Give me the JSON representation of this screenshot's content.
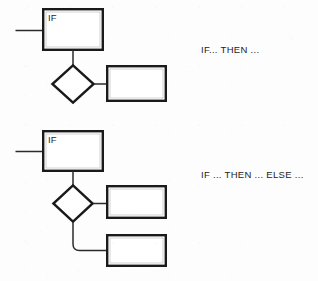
{
  "diagram": {
    "type": "flowchart",
    "background_color": "#fdfdfd",
    "stroke_color": "#1a1a1a",
    "connector_color": "#2b2b2b",
    "blocks": [
      {
        "id": "if-then",
        "caption": "IF... THEN ...",
        "condition_label": "IF",
        "nodes": [
          {
            "name": "condition-box",
            "shape": "rectangle",
            "label": "IF"
          },
          {
            "name": "decision-diamond",
            "shape": "diamond",
            "label": ""
          },
          {
            "name": "then-action-box",
            "shape": "rectangle",
            "label": ""
          }
        ],
        "edges": [
          {
            "from": "entry",
            "to": "condition-box"
          },
          {
            "from": "condition-box",
            "to": "decision-diamond"
          },
          {
            "from": "decision-diamond",
            "to": "then-action-box"
          }
        ]
      },
      {
        "id": "if-then-else",
        "caption": "IF ... THEN ... ELSE ...",
        "condition_label": "IF",
        "nodes": [
          {
            "name": "condition-box",
            "shape": "rectangle",
            "label": "IF"
          },
          {
            "name": "decision-diamond",
            "shape": "diamond",
            "label": ""
          },
          {
            "name": "then-action-box",
            "shape": "rectangle",
            "label": ""
          },
          {
            "name": "else-action-box",
            "shape": "rectangle",
            "label": ""
          }
        ],
        "edges": [
          {
            "from": "entry",
            "to": "condition-box"
          },
          {
            "from": "condition-box",
            "to": "decision-diamond"
          },
          {
            "from": "decision-diamond",
            "to": "then-action-box"
          },
          {
            "from": "decision-diamond",
            "to": "else-action-box"
          }
        ]
      }
    ]
  }
}
